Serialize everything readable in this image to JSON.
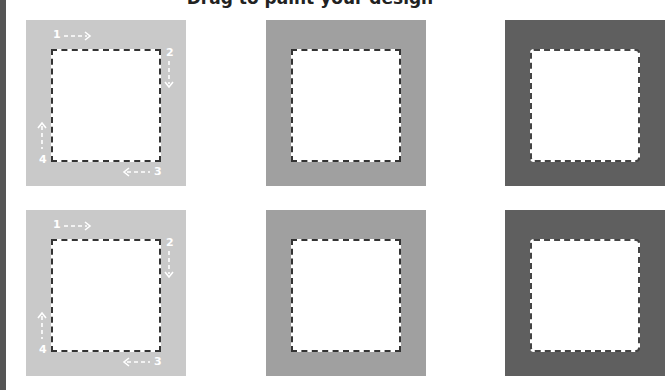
{
  "title": "Drag to paint your design",
  "colors": {
    "left_bar": "#555555",
    "light": "#c9c9c9",
    "mid": "#a0a0a0",
    "dark": "#5f5f5f",
    "inner": "#ffffff",
    "dash": "#333333",
    "label": "#ffffff"
  },
  "rows": [
    {
      "panels": [
        {
          "shade": "light",
          "steps": [
            "1",
            "2",
            "3",
            "4"
          ]
        },
        {
          "shade": "mid"
        },
        {
          "shade": "dark"
        }
      ]
    },
    {
      "panels": [
        {
          "shade": "light",
          "steps": [
            "1",
            "2",
            "3",
            "4"
          ]
        },
        {
          "shade": "mid"
        },
        {
          "shade": "dark"
        }
      ]
    }
  ]
}
